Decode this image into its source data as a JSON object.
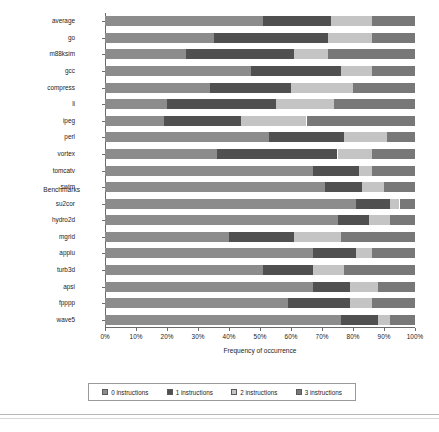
{
  "chart_data": {
    "type": "bar",
    "orientation": "horizontal",
    "stacked": true,
    "title": "",
    "xlabel": "Frequency of occurrence",
    "ylabel": "Benchmarks",
    "xlim": [
      0,
      100
    ],
    "xunit": "%",
    "grid": false,
    "legend_position": "bottom",
    "xticks": [
      "0%",
      "10%",
      "20%",
      "30%",
      "40%",
      "50%",
      "60%",
      "70%",
      "80%",
      "90%",
      "100%"
    ],
    "xtick_values": [
      0,
      10,
      20,
      30,
      40,
      50,
      60,
      70,
      80,
      90,
      100
    ],
    "categories": [
      "average",
      "go",
      "m88ksim",
      "gcc",
      "compress",
      "li",
      "ipeg",
      "perl",
      "vortex",
      "tomcatv",
      "swim",
      "su2cor",
      "hydro2d",
      "mgrid",
      "applu",
      "turb3d",
      "apsi",
      "fpppp",
      "wave5"
    ],
    "series": [
      {
        "name": "0 instructions",
        "color": "#8c8c8c",
        "values": [
          51,
          35,
          26,
          47,
          34,
          20,
          19,
          53,
          36,
          67,
          71,
          81,
          75,
          40,
          67,
          51,
          67,
          59,
          76
        ]
      },
      {
        "name": "1 instructions",
        "color": "#505050",
        "values": [
          22,
          37,
          35,
          29,
          26,
          35,
          25,
          24,
          39,
          15,
          12,
          11,
          10,
          21,
          14,
          16,
          12,
          20,
          12
        ]
      },
      {
        "name": "2 instructions",
        "color": "#c4c4c4",
        "values": [
          13,
          14,
          11,
          10,
          20,
          19,
          21,
          14,
          11,
          4,
          7,
          3,
          7,
          15,
          5,
          10,
          9,
          7,
          4
        ]
      },
      {
        "name": "3 instructions",
        "color": "#787878",
        "values": [
          14,
          14,
          28,
          14,
          20,
          26,
          35,
          9,
          14,
          14,
          10,
          5,
          8,
          24,
          14,
          23,
          12,
          14,
          8
        ]
      }
    ]
  },
  "legend": {
    "items": [
      {
        "label": "0 instructions",
        "color": "#8c8c8c"
      },
      {
        "label": "1 instructions",
        "color": "#505050"
      },
      {
        "label": "2 instructions",
        "color": "#c4c4c4"
      },
      {
        "label": "3 instructions",
        "color": "#787878"
      }
    ]
  }
}
